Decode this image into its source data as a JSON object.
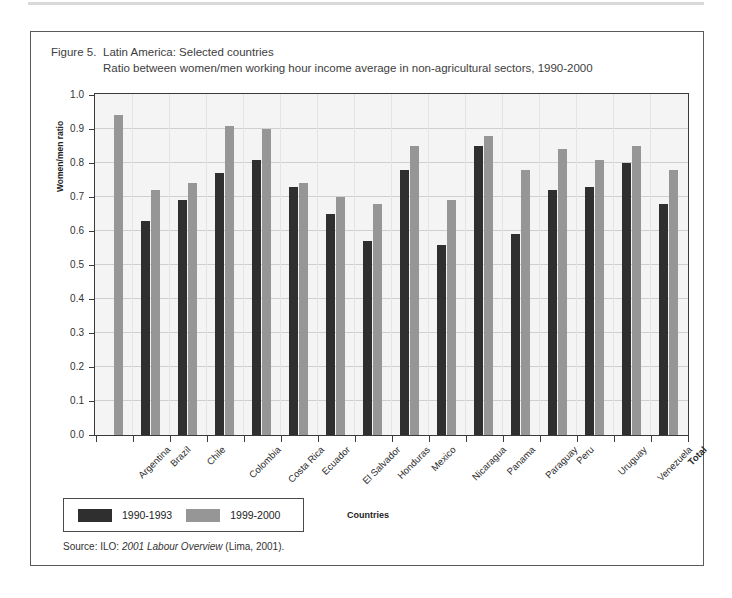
{
  "figure": {
    "number_label": "Figure 5.",
    "title_line1": "Latin America: Selected countries",
    "title_line2": "Ratio between women/men working hour income average in non-agricultural sectors, 1990-2000",
    "source_prefix": "Source: ILO: ",
    "source_italic": "2001 Labour Overview",
    "source_suffix": " (Lima, 2001)."
  },
  "colors": {
    "series_1990_1993": "#2f2f2f",
    "series_1999_2000": "#969696",
    "plot_background": "#f4f4f4",
    "gridline": "#cfcfcf",
    "axis": "#3a3a3a",
    "frame": "#5a5a5a"
  },
  "chart_data": {
    "type": "bar",
    "xlabel": "Countries",
    "ylabel": "Women/men ratio",
    "ylim": [
      0.0,
      1.0
    ],
    "ytick_labels": [
      "0.0",
      "0.1",
      "0.2",
      "0.3",
      "0.4",
      "0.5",
      "0.6",
      "0.7",
      "0.8",
      "0.9",
      "1.0"
    ],
    "ytick_values": [
      0.0,
      0.1,
      0.2,
      0.3,
      0.4,
      0.5,
      0.6,
      0.7,
      0.8,
      0.9,
      1.0
    ],
    "grid": true,
    "legend_position": "below-left",
    "categories": [
      "Argentina",
      "Brazil",
      "Chile",
      "Colombia",
      "Costa Rica",
      "Ecuador",
      "El Salvador",
      "Honduras",
      "Mexico",
      "Nicaragua",
      "Panama",
      "Paraguay",
      "Peru",
      "Uruguay",
      "Venezuela",
      "Total"
    ],
    "bold_categories": [
      "Total"
    ],
    "series": [
      {
        "name": "1990-1993",
        "color": "#2f2f2f",
        "values": [
          null,
          0.63,
          0.69,
          0.77,
          0.81,
          0.73,
          0.65,
          0.57,
          0.78,
          0.56,
          0.85,
          0.59,
          0.72,
          0.73,
          0.8,
          0.68
        ]
      },
      {
        "name": "1999-2000",
        "color": "#969696",
        "values": [
          0.94,
          0.72,
          0.74,
          0.91,
          0.9,
          0.74,
          0.7,
          0.68,
          0.85,
          0.69,
          0.88,
          0.78,
          0.84,
          0.81,
          0.85,
          0.78
        ]
      }
    ]
  },
  "legend": {
    "items": [
      {
        "label": "1990-1993",
        "swatch": "dark"
      },
      {
        "label": "1999-2000",
        "swatch": "light"
      }
    ]
  }
}
